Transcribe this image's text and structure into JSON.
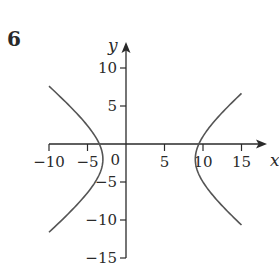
{
  "figure": {
    "number": "6"
  },
  "chart_data": {
    "type": "line",
    "title": "",
    "xlabel": "x",
    "ylabel": "y",
    "equation": "(x-3)^2/36 - (y+2)^2/25 = 1",
    "center": [
      3,
      -2
    ],
    "vertices": [
      [
        -3,
        -2
      ],
      [
        9,
        -2
      ]
    ],
    "xlim": [
      -10,
      15
    ],
    "ylim": [
      -15,
      10
    ],
    "x_ticks": [
      -10,
      -5,
      0,
      5,
      10,
      15
    ],
    "y_ticks": [
      -15,
      -10,
      -5,
      0,
      5,
      10
    ],
    "x_tick_labels": [
      "−10",
      "−5",
      "5",
      "10",
      "15"
    ],
    "y_tick_labels": [
      "10",
      "5",
      "−5",
      "−10",
      "−15"
    ],
    "origin_label": "0",
    "grid": false,
    "legend": null,
    "series": [
      {
        "name": "left branch",
        "x": [
          -10,
          -8,
          -6,
          -4,
          -3,
          -4,
          -6,
          -8,
          -10
        ],
        "y": [
          7.6,
          5.3,
          2.8,
          0.3,
          -2,
          -4.3,
          -6.8,
          -9.3,
          -11.6
        ]
      },
      {
        "name": "right branch",
        "x": [
          15,
          13,
          11,
          10,
          9,
          10,
          11,
          13,
          15
        ],
        "y": [
          6.7,
          4.2,
          2.0,
          0.8,
          -2,
          -4.8,
          -6.0,
          -8.2,
          -10.7
        ]
      }
    ],
    "color": "#555555"
  }
}
